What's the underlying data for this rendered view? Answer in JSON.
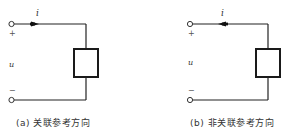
{
  "figures": [
    {
      "id": "a",
      "caption": "(a) 关联参考方向",
      "current_label": "i",
      "voltage_label": "u",
      "plus_label": "+",
      "minus_label": "−",
      "arrow_direction": "right"
    },
    {
      "id": "b",
      "caption": "(b) 非关联参考方向",
      "current_label": "i",
      "voltage_label": "u",
      "plus_label": "+",
      "minus_label": "−",
      "arrow_direction": "left"
    }
  ],
  "colors": {
    "wire": "#222222",
    "box": "#1a1a1a",
    "text": "#333333"
  }
}
